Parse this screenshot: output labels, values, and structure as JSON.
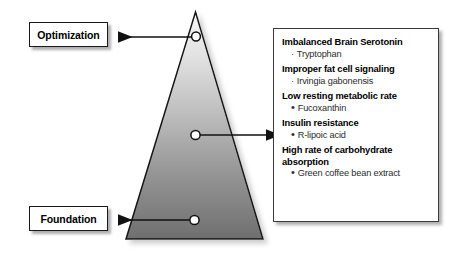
{
  "diagram": {
    "labels": {
      "top": "Optimization",
      "bottom": "Foundation"
    },
    "markers": [
      {
        "name": "apex-marker"
      },
      {
        "name": "middle-marker"
      },
      {
        "name": "base-marker"
      }
    ],
    "arrows": [
      {
        "name": "arrow-to-optimization",
        "direction": "left"
      },
      {
        "name": "arrow-to-details",
        "direction": "right"
      },
      {
        "name": "arrow-to-foundation",
        "direction": "left"
      }
    ],
    "colors": {
      "triangle_top": "#f2f2f2",
      "triangle_bottom": "#767676",
      "outline": "#1a1a1a",
      "box_border": "#3a3a3a",
      "text": "#000000",
      "item_text": "#2b2b2b",
      "background": "#ffffff"
    }
  },
  "details": {
    "groups": [
      {
        "title": "Imbalanced Brain Serotonin",
        "bullet_style": "small",
        "items": [
          "Tryptophan"
        ]
      },
      {
        "title": "Improper fat cell signaling",
        "bullet_style": "small",
        "items": [
          "Irvingia gabonensis"
        ]
      },
      {
        "title": "Low resting metabolic rate",
        "bullet_style": "large",
        "items": [
          "Fucoxanthin"
        ]
      },
      {
        "title": "Insulin resistance",
        "bullet_style": "large",
        "items": [
          "R-lipoic acid"
        ]
      },
      {
        "title": "High rate of carbohydrate absorption",
        "bullet_style": "large",
        "items": [
          "Green coffee bean extract"
        ]
      }
    ],
    "bullet_glyphs": {
      "small": "·",
      "large": "•"
    }
  }
}
